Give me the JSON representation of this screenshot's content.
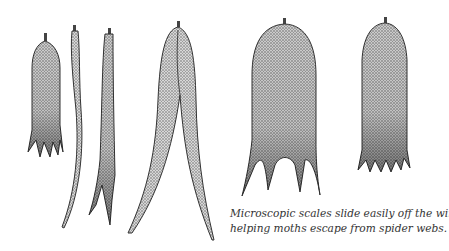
{
  "figure": {
    "scales": [
      {
        "id": "scale-1",
        "shape": "short rounded scale with five toothed tips"
      },
      {
        "id": "scale-2",
        "shape": "long narrow curved scale"
      },
      {
        "id": "scale-3",
        "shape": "narrow scale with forked base"
      },
      {
        "id": "scale-4",
        "shape": "large double-lobed tapering scale"
      },
      {
        "id": "scale-5",
        "shape": "rounded scale with three long prongs"
      },
      {
        "id": "scale-6",
        "shape": "rounded scale with six short teeth"
      }
    ],
    "ink_color": "#3a3a3a",
    "fill_color": "#b9b9b9"
  },
  "caption": {
    "line1": "Microscopic scales slide easily off the wings,",
    "line2": "helping moths escape from spider webs."
  }
}
